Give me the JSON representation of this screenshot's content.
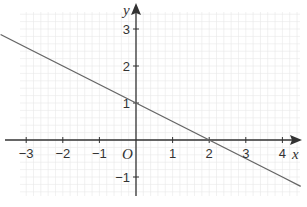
{
  "chart_data": {
    "type": "line",
    "title": "",
    "xlabel": "x",
    "ylabel": "y",
    "origin_label": "O",
    "xlim": [
      -3.7,
      4.6
    ],
    "ylim": [
      -1.7,
      3.3
    ],
    "grid": true,
    "x_ticks": [
      -3,
      -2,
      -1,
      1,
      2,
      3,
      4
    ],
    "y_ticks": [
      -1,
      1,
      2,
      3
    ],
    "x_tick_labels": [
      "−3",
      "−2",
      "−1",
      "1",
      "2",
      "3",
      "4"
    ],
    "y_tick_labels": [
      "−1",
      "1",
      "2",
      "3"
    ],
    "series": [
      {
        "name": "y = 1 - x/2",
        "x": [
          -3.7,
          -3,
          -2,
          -1,
          0,
          1,
          2,
          3,
          4,
          4.5
        ],
        "y": [
          2.85,
          2.5,
          2,
          1.5,
          1,
          0.5,
          0,
          -0.5,
          -1,
          -1.25
        ]
      }
    ],
    "colors": {
      "line": "#666666",
      "axis": "#333333",
      "grid": "#e8e8e8"
    }
  }
}
